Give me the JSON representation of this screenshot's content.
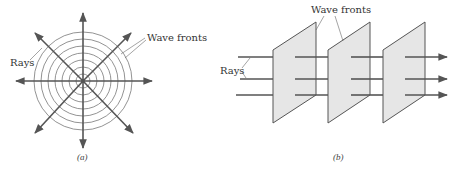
{
  "figure_a": {
    "caption": "(a)",
    "labels": {
      "rays": "Rays",
      "wave_fronts": "Wave fronts"
    },
    "center": [
      83,
      81
    ],
    "ring_radii": [
      7,
      14,
      21,
      28,
      35,
      42,
      49
    ]
  },
  "figure_b": {
    "caption": "(b)",
    "labels": {
      "rays": "Rays",
      "wave_fronts": "Wave fronts"
    },
    "plate_count": 3,
    "ray_count": 3
  },
  "colors": {
    "ray": "#555555",
    "plate_fill": "#e6e6e6",
    "ring": "#777777"
  }
}
